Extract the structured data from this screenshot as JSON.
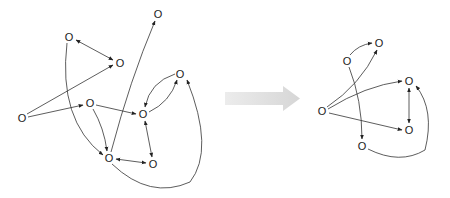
{
  "diagram": {
    "type": "graph-transformation",
    "node_label": "O",
    "colors": {
      "edge": "#333333",
      "node_text": "#222222",
      "transform_arrow": "#d9d9d9",
      "background": "#ffffff"
    },
    "left_graph": {
      "nodes": [
        {
          "id": "A",
          "label": "O",
          "x": 69,
          "y": 37
        },
        {
          "id": "B",
          "label": "O",
          "x": 120,
          "y": 63
        },
        {
          "id": "C",
          "label": "O",
          "x": 22,
          "y": 118
        },
        {
          "id": "D",
          "label": "O",
          "x": 90,
          "y": 103
        },
        {
          "id": "E",
          "label": "O",
          "x": 109,
          "y": 158
        },
        {
          "id": "F",
          "label": "O",
          "x": 153,
          "y": 164
        },
        {
          "id": "G",
          "label": "O",
          "x": 143,
          "y": 114
        },
        {
          "id": "H",
          "label": "O",
          "x": 180,
          "y": 74
        },
        {
          "id": "I",
          "label": "O",
          "x": 158,
          "y": 14
        }
      ],
      "edges": [
        {
          "from": "A",
          "to": "B",
          "directed": "both"
        },
        {
          "from": "C",
          "to": "B",
          "directed": "forward"
        },
        {
          "from": "C",
          "to": "D",
          "directed": "forward"
        },
        {
          "from": "D",
          "to": "G",
          "directed": "forward"
        },
        {
          "from": "D",
          "to": "E",
          "directed": "forward"
        },
        {
          "from": "A",
          "to": "E",
          "directed": "forward"
        },
        {
          "from": "E",
          "to": "I",
          "directed": "forward"
        },
        {
          "from": "E",
          "to": "F",
          "directed": "both"
        },
        {
          "from": "G",
          "to": "F",
          "directed": "both"
        },
        {
          "from": "G",
          "to": "H",
          "directed": "forward"
        },
        {
          "from": "H",
          "to": "G",
          "directed": "forward"
        },
        {
          "from": "E",
          "to": "H",
          "directed": "forward"
        }
      ]
    },
    "transform_arrow": {
      "direction": "right"
    },
    "right_graph": {
      "nodes": [
        {
          "id": "R1",
          "label": "O",
          "x": 347,
          "y": 61
        },
        {
          "id": "R2",
          "label": "O",
          "x": 379,
          "y": 43
        },
        {
          "id": "R3",
          "label": "O",
          "x": 322,
          "y": 111
        },
        {
          "id": "R4",
          "label": "O",
          "x": 409,
          "y": 81
        },
        {
          "id": "R5",
          "label": "O",
          "x": 409,
          "y": 130
        },
        {
          "id": "R6",
          "label": "O",
          "x": 362,
          "y": 146
        }
      ],
      "edges": [
        {
          "from": "R1",
          "to": "R2",
          "directed": "forward"
        },
        {
          "from": "R3",
          "to": "R2",
          "directed": "forward"
        },
        {
          "from": "R3",
          "to": "R4",
          "directed": "forward"
        },
        {
          "from": "R3",
          "to": "R5",
          "directed": "forward"
        },
        {
          "from": "R1",
          "to": "R6",
          "directed": "forward"
        },
        {
          "from": "R4",
          "to": "R5",
          "directed": "both"
        },
        {
          "from": "R6",
          "to": "R4",
          "directed": "forward"
        }
      ]
    }
  }
}
